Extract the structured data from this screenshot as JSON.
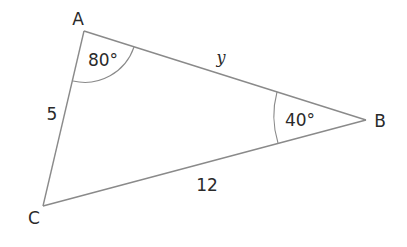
{
  "diagram": {
    "type": "triangle",
    "vertices": {
      "A": {
        "label": "A",
        "x": 84,
        "y": 31
      },
      "B": {
        "label": "B",
        "x": 366,
        "y": 120
      },
      "C": {
        "label": "C",
        "x": 43,
        "y": 206
      }
    },
    "angles": {
      "A": {
        "value": "80°"
      },
      "B": {
        "value": "40°"
      }
    },
    "sides": {
      "AC": {
        "label": "5"
      },
      "AB": {
        "label": "y"
      },
      "BC": {
        "label": "12"
      }
    },
    "colors": {
      "line": "#8a8a8a",
      "text": "#2a2a2a",
      "background": "#ffffff"
    }
  }
}
